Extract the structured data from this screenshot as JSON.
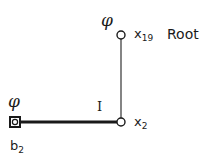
{
  "diagram": {
    "nodes": {
      "root": {
        "symbol": "φ",
        "name_base": "x",
        "name_sub": "19",
        "role": "Root"
      },
      "middle": {
        "name_base": "x",
        "name_sub": "2"
      },
      "leaf": {
        "symbol": "φ",
        "name_base": "b",
        "name_sub": "2"
      }
    },
    "edges": [
      {
        "from": "root",
        "to": "middle",
        "style": "thin"
      },
      {
        "from": "middle",
        "to": "leaf",
        "style": "thick",
        "label": "I"
      }
    ],
    "colors": {
      "ink": "#1a1a1a",
      "background": "#ffffff"
    }
  }
}
